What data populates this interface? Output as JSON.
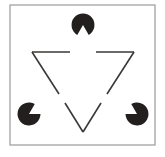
{
  "figure": {
    "type": "illusory-contour-diagram",
    "canvas": {
      "width": 165,
      "height": 157
    },
    "background_color": "#ffffff"
  },
  "frame": {
    "name": "figure-border",
    "x": 10,
    "y": 5,
    "width": 145,
    "height": 140,
    "stroke_color": "#9a9a9a",
    "stroke_width": 1.2,
    "fill": "none"
  },
  "inducers": {
    "label": "pac-man discs",
    "fill_color": "#231f1e",
    "radius": 11.5,
    "wedge_angle_degrees": 60,
    "items": [
      {
        "name": "pacman-top",
        "position_label": "top",
        "cx": 83,
        "cy": 25,
        "mouth_direction_degrees": 90,
        "mouth_direction_label": "down"
      },
      {
        "name": "pacman-bottom-left",
        "position_label": "bottom-left",
        "cx": 29,
        "cy": 114,
        "mouth_direction_degrees": 330,
        "mouth_direction_label": "upper-right"
      },
      {
        "name": "pacman-bottom-right",
        "position_label": "bottom-right",
        "cx": 137,
        "cy": 114,
        "mouth_direction_degrees": 210,
        "mouth_direction_label": "upper-left"
      }
    ]
  },
  "outline_triangle": {
    "label": "inverted outline triangle with gaps",
    "stroke_color": "#3b3836",
    "stroke_width": 1.6,
    "orientation": "point-down",
    "vertices": [
      {
        "name": "vertex-top-left",
        "x": 32,
        "y": 52
      },
      {
        "name": "vertex-top-right",
        "x": 134,
        "y": 52
      },
      {
        "name": "vertex-bottom",
        "x": 83,
        "y": 132
      }
    ],
    "segments": [
      {
        "name": "segment-top-left",
        "x1": 32,
        "y1": 52,
        "x2": 70,
        "y2": 52
      },
      {
        "name": "segment-top-right",
        "x1": 96,
        "y1": 52,
        "x2": 134,
        "y2": 52
      },
      {
        "name": "segment-left-diagonal",
        "x1": 32,
        "y1": 52,
        "x2": 59,
        "y2": 94
      },
      {
        "name": "segment-right-diagonal",
        "x1": 134,
        "y1": 52,
        "x2": 107,
        "y2": 94
      },
      {
        "name": "segment-bottom-left-diagonal",
        "x1": 65,
        "y1": 103,
        "x2": 83,
        "y2": 132
      },
      {
        "name": "segment-bottom-right-diagonal",
        "x1": 101,
        "y1": 103,
        "x2": 83,
        "y2": 132
      }
    ]
  }
}
